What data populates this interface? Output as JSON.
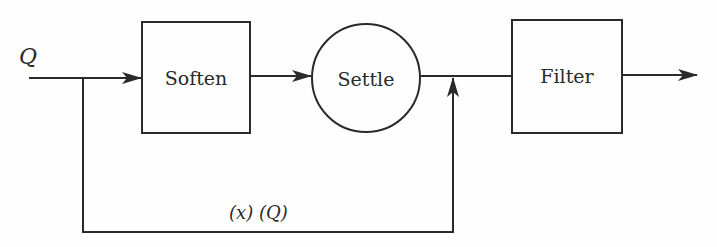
{
  "diagram": {
    "type": "block-flow-diagram",
    "input_label": "Q",
    "blocks": [
      {
        "id": "soften",
        "label": "Soften",
        "shape": "rectangle"
      },
      {
        "id": "settle",
        "label": "Settle",
        "shape": "circle"
      },
      {
        "id": "filter",
        "label": "Filter",
        "shape": "rectangle"
      }
    ],
    "bypass_label": "(x) (Q)",
    "edges": [
      {
        "from": "input",
        "to": "soften"
      },
      {
        "from": "soften",
        "to": "settle"
      },
      {
        "from": "settle",
        "to": "filter"
      },
      {
        "from": "input",
        "to": "settle-output-junction",
        "label": "(x) (Q)"
      },
      {
        "from": "filter",
        "to": "output"
      }
    ],
    "colors": {
      "stroke": "#2a2a2a",
      "background": "#fefefe"
    }
  }
}
